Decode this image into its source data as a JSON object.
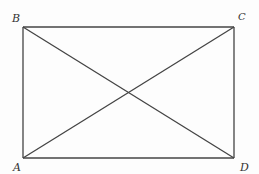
{
  "diagram": {
    "type": "rectangle-with-diagonals",
    "stroke_color": "#444444",
    "background": "#fdfdfd",
    "vertices": [
      {
        "id": "A",
        "label": "A",
        "x": 23,
        "y": 158
      },
      {
        "id": "B",
        "label": "B",
        "x": 23,
        "y": 27
      },
      {
        "id": "C",
        "label": "C",
        "x": 234,
        "y": 27
      },
      {
        "id": "D",
        "label": "D",
        "x": 234,
        "y": 158
      }
    ],
    "edges": [
      {
        "from": "A",
        "to": "B"
      },
      {
        "from": "B",
        "to": "C"
      },
      {
        "from": "C",
        "to": "D"
      },
      {
        "from": "D",
        "to": "A"
      },
      {
        "from": "A",
        "to": "C"
      },
      {
        "from": "B",
        "to": "D"
      }
    ],
    "labels": {
      "A": "A",
      "B": "B",
      "C": "C",
      "D": "D"
    }
  }
}
